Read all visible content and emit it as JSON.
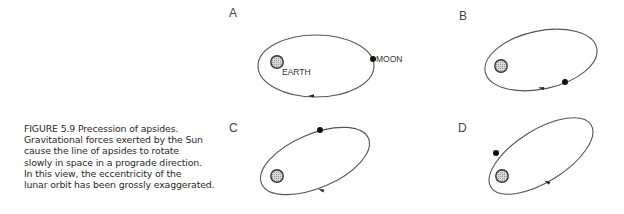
{
  "figure": {
    "caption_lines": [
      "FIGURE 5.9  Precession of apsides.",
      "Gravitational forces exerted by the Sun",
      "cause the line of apsides to rotate",
      "slowly in space in a prograde direction.",
      "In this view, the eccentricity of the",
      "lunar orbit has been grossly exaggerated."
    ],
    "panels": [
      {
        "label": "A",
        "label_pos": [
          229,
          17
        ],
        "orbit": {
          "cx": 316,
          "cy": 66,
          "rx": 58,
          "ry": 31,
          "rot": 0
        },
        "earth": [
          277,
          62
        ],
        "moon": [
          373,
          59
        ],
        "arrow": [
          311,
          96
        ],
        "arrow_angle": 178,
        "earth_label": "EARTH",
        "moon_label": "MOON"
      },
      {
        "label": "B",
        "label_pos": [
          459,
          20
        ],
        "orbit": {
          "cx": 541,
          "cy": 60,
          "rx": 57,
          "ry": 29,
          "rot": -12
        },
        "earth": [
          501,
          66
        ],
        "moon": [
          565,
          82
        ],
        "arrow": [
          541,
          88
        ],
        "arrow_angle": 190
      },
      {
        "label": "C",
        "label_pos": [
          229,
          132
        ],
        "orbit": {
          "cx": 315,
          "cy": 161,
          "rx": 58,
          "ry": 27,
          "rot": -23
        },
        "earth": [
          277,
          176
        ],
        "moon": [
          320,
          130
        ],
        "arrow": [
          321,
          190
        ],
        "arrow_angle": 200
      },
      {
        "label": "D",
        "label_pos": [
          458,
          132
        ],
        "orbit": {
          "cx": 541,
          "cy": 156,
          "rx": 59,
          "ry": 26,
          "rot": -32
        },
        "earth": [
          502,
          176
        ],
        "moon": [
          496,
          153
        ],
        "arrow": [
          547,
          182
        ],
        "arrow_angle": 208
      }
    ]
  }
}
